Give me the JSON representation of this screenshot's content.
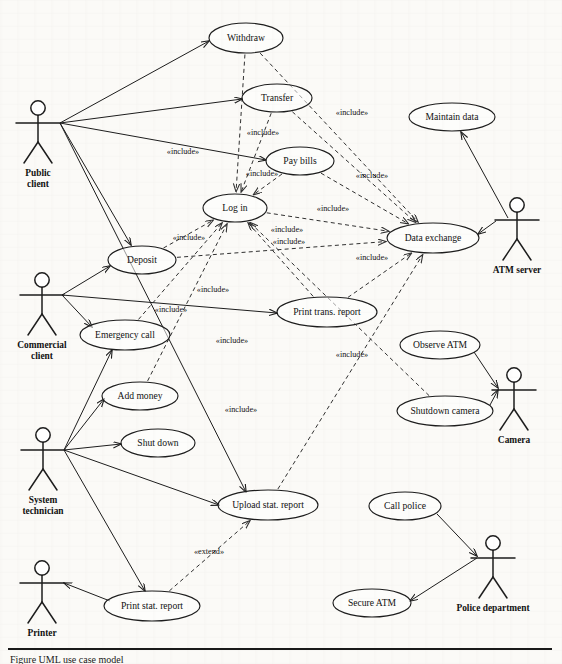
{
  "diagram": {
    "caption": "Figure  UML use case model",
    "stroke_color": "#1d1d1d",
    "background_color": "#fbfaf7"
  },
  "actors": [
    {
      "id": "public-client",
      "label_line1": "Public",
      "label_line2": "client",
      "x": 38,
      "y": 108
    },
    {
      "id": "commercial-client",
      "label_line1": "Commercial",
      "label_line2": "client",
      "x": 42,
      "y": 280
    },
    {
      "id": "system-technician",
      "label_line1": "System",
      "label_line2": "technician",
      "x": 43,
      "y": 435
    },
    {
      "id": "printer",
      "label_line1": "Printer",
      "label_line2": "",
      "x": 42,
      "y": 568
    },
    {
      "id": "atm-server",
      "label_line1": "ATM server",
      "label_line2": "",
      "x": 517,
      "y": 205
    },
    {
      "id": "camera",
      "label_line1": "Camera",
      "label_line2": "",
      "x": 514,
      "y": 375
    },
    {
      "id": "police-department",
      "label_line1": "Police department",
      "label_line2": "",
      "x": 493,
      "y": 543
    }
  ],
  "use_cases": [
    {
      "id": "withdraw",
      "label": "Withdraw",
      "cx": 246,
      "cy": 38,
      "rx": 37,
      "ry": 15
    },
    {
      "id": "transfer",
      "label": "Transfer",
      "cx": 277,
      "cy": 98,
      "rx": 35,
      "ry": 14
    },
    {
      "id": "pay-bills",
      "label": "Pay bills",
      "cx": 300,
      "cy": 161,
      "rx": 34,
      "ry": 14
    },
    {
      "id": "log-in",
      "label": "Log in",
      "cx": 235,
      "cy": 208,
      "rx": 32,
      "ry": 14
    },
    {
      "id": "deposit",
      "label": "Deposit",
      "cx": 142,
      "cy": 260,
      "rx": 34,
      "ry": 14
    },
    {
      "id": "emergency-call",
      "label": "Emergency call",
      "cx": 125,
      "cy": 335,
      "rx": 45,
      "ry": 15
    },
    {
      "id": "add-money",
      "label": "Add money",
      "cx": 140,
      "cy": 396,
      "rx": 38,
      "ry": 14
    },
    {
      "id": "shut-down",
      "label": "Shut down",
      "cx": 158,
      "cy": 443,
      "rx": 37,
      "ry": 14
    },
    {
      "id": "print-trans-report",
      "label": "Print trans. report",
      "cx": 327,
      "cy": 312,
      "rx": 50,
      "ry": 15
    },
    {
      "id": "data-exchange",
      "label": "Data exchange",
      "cx": 433,
      "cy": 238,
      "rx": 46,
      "ry": 15
    },
    {
      "id": "maintain-data",
      "label": "Maintain data",
      "cx": 452,
      "cy": 117,
      "rx": 43,
      "ry": 14
    },
    {
      "id": "observe-atm",
      "label": "Observe ATM",
      "cx": 440,
      "cy": 345,
      "rx": 40,
      "ry": 14
    },
    {
      "id": "shutdown-camera",
      "label": "Shutdown camera",
      "cx": 445,
      "cy": 411,
      "rx": 48,
      "ry": 15
    },
    {
      "id": "upload-stat-report",
      "label": "Upload stat. report",
      "cx": 268,
      "cy": 505,
      "rx": 50,
      "ry": 15
    },
    {
      "id": "call-police",
      "label": "Call police",
      "cx": 405,
      "cy": 506,
      "rx": 36,
      "ry": 14
    },
    {
      "id": "print-stat-report",
      "label": "Print stat. report",
      "cx": 152,
      "cy": 606,
      "rx": 48,
      "ry": 15
    },
    {
      "id": "secure-atm",
      "label": "Secure ATM",
      "cx": 372,
      "cy": 603,
      "rx": 39,
      "ry": 14
    }
  ],
  "associations": [
    {
      "id": "public-client-to-withdraw",
      "from": "public-client",
      "to": "withdraw",
      "x1": 60,
      "y1": 123,
      "x2": 209,
      "y2": 41
    },
    {
      "id": "public-client-to-transfer",
      "from": "public-client",
      "to": "transfer",
      "x1": 60,
      "y1": 123,
      "x2": 242,
      "y2": 99
    },
    {
      "id": "public-client-to-pay-bills",
      "from": "public-client",
      "to": "pay-bills",
      "x1": 60,
      "y1": 123,
      "x2": 266,
      "y2": 160
    },
    {
      "id": "public-client-to-deposit",
      "from": "public-client",
      "to": "deposit",
      "x1": 60,
      "y1": 123,
      "x2": 131,
      "y2": 245
    },
    {
      "id": "public-client-to-upload-stat-report",
      "from": "public-client",
      "to": "upload-stat-report",
      "x1": 60,
      "y1": 123,
      "x2": 246,
      "y2": 492
    },
    {
      "id": "commercial-client-to-deposit",
      "from": "commercial-client",
      "to": "deposit",
      "x1": 62,
      "y1": 295,
      "x2": 110,
      "y2": 266
    },
    {
      "id": "commercial-client-to-print-trans-report",
      "from": "commercial-client",
      "to": "print-trans-report",
      "x1": 62,
      "y1": 295,
      "x2": 277,
      "y2": 313
    },
    {
      "id": "commercial-client-to-emergency-call",
      "from": "commercial-client",
      "to": "emergency-call",
      "x1": 62,
      "y1": 295,
      "x2": 92,
      "y2": 327
    },
    {
      "id": "system-technician-to-emergency-call",
      "from": "system-technician",
      "to": "emergency-call",
      "x1": 64,
      "y1": 450,
      "x2": 112,
      "y2": 350
    },
    {
      "id": "system-technician-to-add-money",
      "from": "system-technician",
      "to": "add-money",
      "x1": 64,
      "y1": 450,
      "x2": 104,
      "y2": 399
    },
    {
      "id": "system-technician-to-shut-down",
      "from": "system-technician",
      "to": "shut-down",
      "x1": 64,
      "y1": 450,
      "x2": 121,
      "y2": 444
    },
    {
      "id": "system-technician-to-upload-stat-report",
      "from": "system-technician",
      "to": "upload-stat-report",
      "x1": 64,
      "y1": 450,
      "x2": 219,
      "y2": 505
    },
    {
      "id": "system-technician-to-print-stat-report",
      "from": "system-technician",
      "to": "print-stat-report",
      "x1": 64,
      "y1": 450,
      "x2": 145,
      "y2": 591
    },
    {
      "id": "printer-to-print-stat-report",
      "from": "print-stat-report",
      "to": "printer",
      "x1": 110,
      "y1": 601,
      "x2": 64,
      "y2": 583
    },
    {
      "id": "atm-server-to-maintain-data",
      "from": "atm-server",
      "to": "maintain-data",
      "x1": 508,
      "y1": 218,
      "x2": 461,
      "y2": 132
    },
    {
      "id": "atm-server-to-data-exchange",
      "from": "atm-server",
      "to": "data-exchange",
      "x1": 496,
      "y1": 221,
      "x2": 478,
      "y2": 234
    },
    {
      "id": "camera-to-observe-atm",
      "from": "observe-atm",
      "to": "camera",
      "x1": 474,
      "y1": 352,
      "x2": 498,
      "y2": 388
    },
    {
      "id": "camera-to-shutdown-camera",
      "from": "shutdown-camera",
      "to": "camera",
      "x1": 490,
      "y1": 405,
      "x2": 498,
      "y2": 390
    },
    {
      "id": "police-to-call-police",
      "from": "call-police",
      "to": "police-department",
      "x1": 437,
      "y1": 514,
      "x2": 477,
      "y2": 556
    },
    {
      "id": "police-to-secure-atm",
      "from": "police-department",
      "to": "secure-atm",
      "x1": 477,
      "y1": 558,
      "x2": 410,
      "y2": 601
    }
  ],
  "include_links": [
    {
      "id": "withdraw-includes-log-in",
      "from": "withdraw",
      "to": "log-in",
      "label": "«include»",
      "lx": 183,
      "ly": 152
    },
    {
      "id": "transfer-includes-log-in",
      "from": "transfer",
      "to": "log-in",
      "label": "«include»",
      "lx": 263,
      "ly": 133
    },
    {
      "id": "pay-bills-includes-log-in",
      "from": "pay-bills",
      "to": "log-in",
      "label": "«include»",
      "lx": 262,
      "ly": 174
    },
    {
      "id": "deposit-includes-log-in",
      "from": "deposit",
      "to": "log-in",
      "label": "«include»",
      "lx": 189,
      "ly": 238
    },
    {
      "id": "withdraw-includes-data-exchange",
      "from": "withdraw",
      "to": "data-exchange",
      "label": "«include»",
      "lx": 352,
      "ly": 113
    },
    {
      "id": "transfer-includes-data-exchange",
      "from": "transfer",
      "to": "data-exchange",
      "label": "«include»",
      "lx": 372,
      "ly": 176
    },
    {
      "id": "pay-bills-includes-data-exchange",
      "from": "pay-bills",
      "to": "data-exchange",
      "label": "«include»",
      "lx": 333,
      "ly": 209
    },
    {
      "id": "log-in-includes-data-exchange",
      "from": "log-in",
      "to": "data-exchange",
      "label": "«include»",
      "lx": 287,
      "ly": 230
    },
    {
      "id": "deposit-includes-data-exchange",
      "from": "deposit",
      "to": "data-exchange",
      "label": "«include»",
      "lx": 289,
      "ly": 242
    },
    {
      "id": "print-trans-includes-data-exchange",
      "from": "print-trans-report",
      "to": "data-exchange",
      "label": "«include»",
      "lx": 372,
      "ly": 258
    },
    {
      "id": "print-trans-includes-log-in",
      "from": "print-trans-report",
      "to": "log-in",
      "label": "«include»",
      "lx": 213,
      "ly": 290
    },
    {
      "id": "emergency-call-includes-log-in",
      "from": "emergency-call",
      "to": "log-in",
      "label": "«include»",
      "lx": 171,
      "ly": 310
    },
    {
      "id": "add-money-includes-log-in",
      "from": "add-money",
      "to": "log-in",
      "label": "«include»",
      "lx": 232,
      "ly": 341
    },
    {
      "id": "upload-stat-includes-data-exchange",
      "from": "upload-stat-report",
      "to": "data-exchange",
      "label": "«include»",
      "lx": 352,
      "ly": 355
    },
    {
      "id": "shutdown-camera-includes-log-in",
      "from": "shutdown-camera",
      "to": "log-in",
      "label": "«include»",
      "lx": 241,
      "ly": 410
    }
  ],
  "extend_links": [
    {
      "id": "print-stat-extends-upload-stat",
      "from": "print-stat-report",
      "to": "upload-stat-report",
      "label": "«extend»",
      "lx": 209,
      "ly": 552
    }
  ]
}
